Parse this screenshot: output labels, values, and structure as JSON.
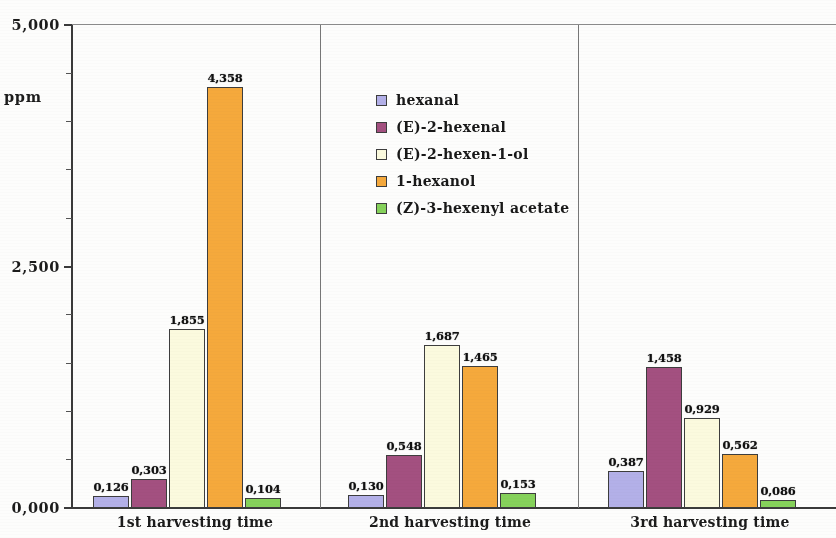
{
  "chart_data": {
    "type": "bar",
    "title": "",
    "subtitle": "",
    "xlabel": "",
    "ylabel": "ppm",
    "ylim": [
      0,
      5000
    ],
    "yticks": [
      "0,000",
      "2,500",
      "5,000"
    ],
    "ytick_values": [
      0,
      2500,
      5000
    ],
    "minor_tick_count": 9,
    "grid": false,
    "legend_position": "upper-center",
    "categories": [
      "1st harvesting time",
      "2nd harvesting time",
      "3rd harvesting time"
    ],
    "series": [
      {
        "name": "hexanal",
        "color": "#b3b0e8",
        "values": [
          126,
          130,
          387
        ],
        "labels": [
          "0,126",
          "0,130",
          "0,387"
        ]
      },
      {
        "name": "(E)-2-hexenal",
        "color": "#a35080",
        "values": [
          303,
          548,
          1458
        ],
        "labels": [
          "0,303",
          "0,548",
          "1,458"
        ]
      },
      {
        "name": "(E)-2-hexen-1-ol",
        "color": "#fbfade",
        "values": [
          1855,
          1687,
          929
        ],
        "labels": [
          "1,855",
          "1,687",
          "0,929"
        ]
      },
      {
        "name": "1-hexanol",
        "color": "#f5a93c",
        "values": [
          4358,
          1465,
          562
        ],
        "labels": [
          "4,358",
          "1,465",
          "0,562"
        ]
      },
      {
        "name": "(Z)-3-hexenyl acetate",
        "color": "#86d25b",
        "values": [
          104,
          153,
          86
        ],
        "labels": [
          "0,104",
          "0,153",
          "0,086"
        ]
      }
    ]
  },
  "axis": {
    "y_title": "ppm",
    "tick_top": "5,000",
    "tick_mid": "2,500",
    "tick_bottom": "0,000"
  },
  "legend": {
    "items": [
      {
        "label": "hexanal",
        "color": "#b3b0e8"
      },
      {
        "label": "(E)-2-hexenal",
        "color": "#a35080"
      },
      {
        "label": "(E)-2-hexen-1-ol",
        "color": "#fbfade"
      },
      {
        "label": "1-hexanol",
        "color": "#f5a93c"
      },
      {
        "label": "(Z)-3-hexenyl acetate",
        "color": "#86d25b"
      }
    ]
  }
}
